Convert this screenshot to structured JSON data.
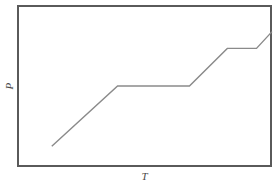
{
  "figure": {
    "background_color": "#ffffff",
    "frame_color": "#5a5a5a",
    "curve_color": "#8a8a8a",
    "label_color": "#4a4a4a"
  },
  "chart_data": {
    "type": "line",
    "title": "",
    "subtitle": "",
    "xlabel": "T",
    "ylabel": "P",
    "grid": false,
    "legend": null,
    "axis_ticks": {
      "x": [],
      "y": []
    },
    "xlim": [
      0,
      100
    ],
    "ylim": [
      0,
      100
    ],
    "annotations": [],
    "series": [
      {
        "name": "P vs T",
        "x": [
          13.3,
          39.2,
          67.5,
          82.4,
          93.9,
          100.0
        ],
        "y": [
          12.3,
          50.0,
          50.0,
          73.5,
          73.5,
          84.0
        ],
        "description": "monotonic staircase: rising segment, plateau, rising segment, plateau, rising segment"
      }
    ]
  }
}
